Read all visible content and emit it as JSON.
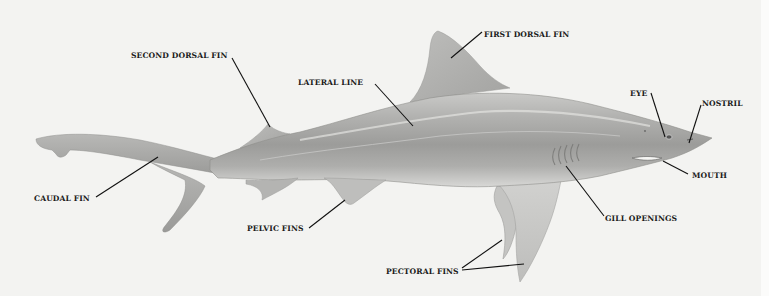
{
  "diagram": {
    "colors": {
      "background": "#f3f3f1",
      "body_dark": "#8a8a8a",
      "body_mid": "#b4b4b4",
      "body_light": "#d9d9d7",
      "label_text": "#1a1a1a",
      "leader_line": "#111111"
    },
    "labels": [
      {
        "id": "second-dorsal-fin",
        "text": "SECOND DORSAL FIN"
      },
      {
        "id": "lateral-line",
        "text": "LATERAL LINE"
      },
      {
        "id": "first-dorsal-fin",
        "text": "FIRST DORSAL FIN"
      },
      {
        "id": "eye",
        "text": "EYE"
      },
      {
        "id": "nostril",
        "text": "NOSTRIL"
      },
      {
        "id": "mouth",
        "text": "MOUTH"
      },
      {
        "id": "gill-openings",
        "text": "GILL OPENINGS"
      },
      {
        "id": "caudal-fin",
        "text": "CAUDAL FIN"
      },
      {
        "id": "pelvic-fins",
        "text": "PELVIC FINS"
      },
      {
        "id": "pectoral-fins",
        "text": "PECTORAL FINS"
      }
    ]
  }
}
